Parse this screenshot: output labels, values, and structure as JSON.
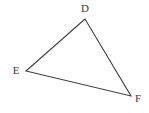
{
  "figure": {
    "type": "geometry-diagram",
    "shape": "triangle",
    "background_color": "#ffffff",
    "stroke_color": "#3f3f3f",
    "stroke_width": 1.1,
    "label_color": "#3a3a3a",
    "width": 149,
    "height": 113,
    "vertices": [
      {
        "name": "D",
        "label": "D",
        "x": 85,
        "y": 19,
        "label_x": 85,
        "label_y": 8
      },
      {
        "name": "E",
        "label": "E",
        "x": 26,
        "y": 71,
        "label_x": 16,
        "label_y": 70
      },
      {
        "name": "F",
        "label": "F",
        "x": 131,
        "y": 96,
        "label_x": 138,
        "label_y": 98
      }
    ],
    "edges": [
      {
        "name": "edge-DE",
        "from": "D",
        "to": "E"
      },
      {
        "name": "edge-EF",
        "from": "E",
        "to": "F"
      },
      {
        "name": "edge-FD",
        "from": "F",
        "to": "D"
      }
    ]
  }
}
